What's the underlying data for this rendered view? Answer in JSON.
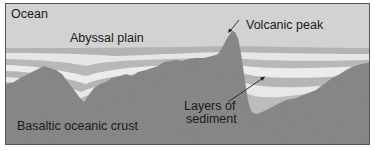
{
  "diagram": {
    "labels": {
      "ocean": "Ocean",
      "abyssal_plain": "Abyssal plain",
      "volcanic_peak": "Volcanic peak",
      "layers_line1": "Layers of",
      "layers_line2": "sediment",
      "crust": "Basaltic oceanic crust"
    },
    "colors": {
      "ocean": "#d2d2d2",
      "band_dark": "#b3b3b3",
      "band_light": "#ededed",
      "band_mid": "#c4c4c4",
      "crust": "#8c8c8c",
      "text": "#1a1a1a"
    }
  }
}
